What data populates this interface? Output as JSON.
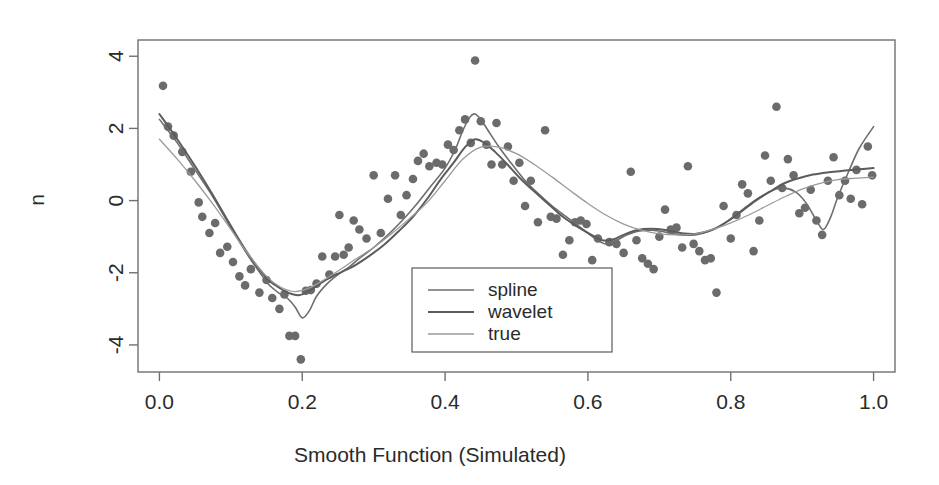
{
  "chart_data": {
    "type": "scatter",
    "title": "",
    "xlabel": "Smooth Function (Simulated)",
    "ylabel": "n",
    "xlim": [
      -0.03,
      1.03
    ],
    "ylim": [
      -4.75,
      4.45
    ],
    "xticks": [
      0.0,
      0.2,
      0.4,
      0.6,
      0.8,
      1.0
    ],
    "xticklabels": [
      "0.0",
      "0.2",
      "0.4",
      "0.6",
      "0.8",
      "1.0"
    ],
    "yticks": [
      4,
      2,
      0,
      -2,
      -4
    ],
    "yticklabels": [
      "4",
      "2",
      "0",
      "-2",
      "-4"
    ],
    "grid": false,
    "frame": true,
    "legend_position": "lower-center",
    "point_color": "#6b6b6b",
    "line_color_spline": "#6e6e6e",
    "line_color_wavelet": "#5c5c5c",
    "line_color_true": "#9a9a9a",
    "frame_color": "#707070",
    "legend": [
      {
        "label": "spline",
        "color": "#6e6e6e",
        "width": 1.6
      },
      {
        "label": "wavelet",
        "color": "#5c5c5c",
        "width": 2.0
      },
      {
        "label": "true",
        "color": "#9a9a9a",
        "width": 1.3
      }
    ],
    "scatter": {
      "name": "observations",
      "x": [
        0.005,
        0.012,
        0.02,
        0.032,
        0.044,
        0.055,
        0.06,
        0.07,
        0.078,
        0.085,
        0.095,
        0.103,
        0.112,
        0.12,
        0.128,
        0.14,
        0.15,
        0.158,
        0.168,
        0.175,
        0.182,
        0.19,
        0.198,
        0.205,
        0.212,
        0.22,
        0.228,
        0.238,
        0.246,
        0.252,
        0.258,
        0.265,
        0.272,
        0.28,
        0.29,
        0.3,
        0.31,
        0.32,
        0.33,
        0.338,
        0.346,
        0.355,
        0.362,
        0.37,
        0.378,
        0.388,
        0.396,
        0.404,
        0.412,
        0.42,
        0.428,
        0.436,
        0.442,
        0.45,
        0.458,
        0.465,
        0.472,
        0.48,
        0.488,
        0.496,
        0.504,
        0.512,
        0.52,
        0.53,
        0.54,
        0.548,
        0.556,
        0.565,
        0.574,
        0.582,
        0.59,
        0.598,
        0.606,
        0.614,
        0.622,
        0.63,
        0.64,
        0.65,
        0.66,
        0.668,
        0.676,
        0.684,
        0.692,
        0.7,
        0.708,
        0.716,
        0.724,
        0.732,
        0.74,
        0.748,
        0.756,
        0.764,
        0.772,
        0.78,
        0.79,
        0.8,
        0.808,
        0.816,
        0.824,
        0.832,
        0.84,
        0.848,
        0.856,
        0.864,
        0.872,
        0.88,
        0.888,
        0.896,
        0.904,
        0.912,
        0.92,
        0.928,
        0.936,
        0.944,
        0.952,
        0.96,
        0.968,
        0.976,
        0.984,
        0.992,
        0.998
      ],
      "y": [
        3.18,
        2.05,
        1.8,
        1.35,
        0.8,
        -0.05,
        -0.45,
        -0.9,
        -0.62,
        -1.45,
        -1.28,
        -1.7,
        -2.1,
        -2.35,
        -1.9,
        -2.55,
        -2.2,
        -2.7,
        -3.0,
        -2.6,
        -3.75,
        -3.75,
        -4.4,
        -2.5,
        -2.48,
        -2.3,
        -1.55,
        -2.05,
        -1.55,
        -0.4,
        -1.5,
        -1.3,
        -0.55,
        -0.8,
        -1.05,
        0.7,
        -0.9,
        0.05,
        0.7,
        -0.4,
        0.15,
        0.6,
        1.1,
        1.3,
        0.95,
        1.05,
        1.0,
        1.55,
        1.4,
        1.95,
        2.25,
        1.6,
        3.88,
        2.2,
        1.55,
        1.0,
        2.15,
        1.0,
        1.5,
        0.55,
        1.05,
        -0.15,
        0.55,
        -0.6,
        1.95,
        -0.45,
        -0.5,
        -1.5,
        -1.1,
        -0.6,
        -0.55,
        -0.65,
        -1.65,
        -1.05,
        -2.6,
        -1.15,
        -1.2,
        -1.45,
        0.8,
        -1.1,
        -1.6,
        -1.75,
        -1.9,
        -1.0,
        -0.25,
        -0.8,
        -0.75,
        -1.3,
        0.95,
        -1.2,
        -1.4,
        -1.65,
        -1.6,
        -2.55,
        -0.15,
        -1.05,
        -0.4,
        0.45,
        0.2,
        -1.4,
        -0.55,
        1.25,
        0.55,
        2.6,
        0.35,
        1.15,
        0.7,
        -0.35,
        -0.2,
        0.3,
        -0.55,
        -0.95,
        0.55,
        1.2,
        0.15,
        0.55,
        0.05,
        0.85,
        -0.1,
        1.5,
        0.7
      ]
    },
    "series": [
      {
        "name": "spline",
        "color": "#6e6e6e",
        "width": 1.6,
        "x": [
          0.0,
          0.025,
          0.05,
          0.075,
          0.1,
          0.125,
          0.15,
          0.16,
          0.17,
          0.18,
          0.19,
          0.2,
          0.21,
          0.22,
          0.235,
          0.25,
          0.265,
          0.28,
          0.3,
          0.32,
          0.34,
          0.36,
          0.38,
          0.4,
          0.415,
          0.425,
          0.435,
          0.442,
          0.45,
          0.46,
          0.475,
          0.49,
          0.51,
          0.53,
          0.55,
          0.57,
          0.59,
          0.61,
          0.625,
          0.64,
          0.655,
          0.67,
          0.69,
          0.71,
          0.73,
          0.75,
          0.77,
          0.79,
          0.81,
          0.83,
          0.85,
          0.87,
          0.89,
          0.905,
          0.92,
          0.93,
          0.94,
          0.95,
          0.965,
          0.98,
          1.0
        ],
        "y": [
          2.25,
          1.6,
          0.85,
          0.1,
          -0.75,
          -1.55,
          -2.25,
          -2.45,
          -2.6,
          -2.72,
          -2.95,
          -3.25,
          -3.05,
          -2.65,
          -2.3,
          -2.05,
          -1.85,
          -1.6,
          -1.3,
          -0.95,
          -0.55,
          -0.1,
          0.4,
          0.9,
          1.45,
          1.95,
          2.32,
          2.4,
          2.25,
          1.95,
          1.5,
          1.1,
          0.6,
          0.2,
          -0.15,
          -0.45,
          -0.75,
          -1.05,
          -1.2,
          -1.1,
          -0.95,
          -0.85,
          -0.82,
          -0.88,
          -0.95,
          -0.95,
          -0.85,
          -0.65,
          -0.35,
          -0.05,
          0.2,
          0.35,
          0.25,
          -0.05,
          -0.55,
          -0.8,
          -0.45,
          0.1,
          0.8,
          1.45,
          2.05
        ]
      },
      {
        "name": "wavelet",
        "color": "#5c5c5c",
        "width": 2.0,
        "x": [
          0.0,
          0.025,
          0.05,
          0.075,
          0.1,
          0.125,
          0.15,
          0.165,
          0.18,
          0.195,
          0.21,
          0.225,
          0.24,
          0.255,
          0.275,
          0.295,
          0.315,
          0.335,
          0.355,
          0.375,
          0.395,
          0.412,
          0.428,
          0.442,
          0.455,
          0.47,
          0.485,
          0.505,
          0.525,
          0.545,
          0.565,
          0.585,
          0.605,
          0.62,
          0.635,
          0.65,
          0.668,
          0.688,
          0.71,
          0.73,
          0.752,
          0.775,
          0.795,
          0.815,
          0.835,
          0.855,
          0.875,
          0.895,
          0.915,
          0.935,
          0.955,
          0.975,
          1.0
        ],
        "y": [
          2.4,
          1.7,
          0.95,
          0.15,
          -0.7,
          -1.5,
          -2.15,
          -2.38,
          -2.55,
          -2.62,
          -2.5,
          -2.3,
          -2.12,
          -1.98,
          -1.78,
          -1.52,
          -1.22,
          -0.85,
          -0.45,
          0.05,
          0.62,
          1.05,
          1.48,
          1.7,
          1.6,
          1.35,
          1.05,
          0.62,
          0.25,
          -0.1,
          -0.45,
          -0.72,
          -0.95,
          -1.1,
          -1.08,
          -0.95,
          -0.82,
          -0.78,
          -0.82,
          -0.9,
          -0.92,
          -0.8,
          -0.58,
          -0.3,
          0.0,
          0.25,
          0.48,
          0.62,
          0.72,
          0.78,
          0.82,
          0.86,
          0.9
        ]
      },
      {
        "name": "true",
        "color": "#9a9a9a",
        "width": 1.3,
        "x": [
          0.0,
          0.025,
          0.05,
          0.075,
          0.1,
          0.125,
          0.15,
          0.17,
          0.19,
          0.21,
          0.23,
          0.25,
          0.275,
          0.3,
          0.325,
          0.35,
          0.375,
          0.4,
          0.425,
          0.45,
          0.475,
          0.5,
          0.525,
          0.55,
          0.575,
          0.6,
          0.625,
          0.65,
          0.675,
          0.7,
          0.725,
          0.75,
          0.775,
          0.8,
          0.825,
          0.85,
          0.875,
          0.9,
          0.925,
          0.95,
          0.975,
          1.0
        ],
        "y": [
          1.7,
          1.15,
          0.55,
          -0.1,
          -0.8,
          -1.5,
          -2.1,
          -2.4,
          -2.52,
          -2.42,
          -2.2,
          -1.95,
          -1.62,
          -1.3,
          -0.92,
          -0.5,
          -0.05,
          0.55,
          1.15,
          1.48,
          1.48,
          1.3,
          1.0,
          0.65,
          0.28,
          -0.08,
          -0.4,
          -0.65,
          -0.82,
          -0.92,
          -0.95,
          -0.92,
          -0.8,
          -0.62,
          -0.4,
          -0.15,
          0.1,
          0.32,
          0.48,
          0.58,
          0.62,
          0.65
        ]
      }
    ]
  }
}
